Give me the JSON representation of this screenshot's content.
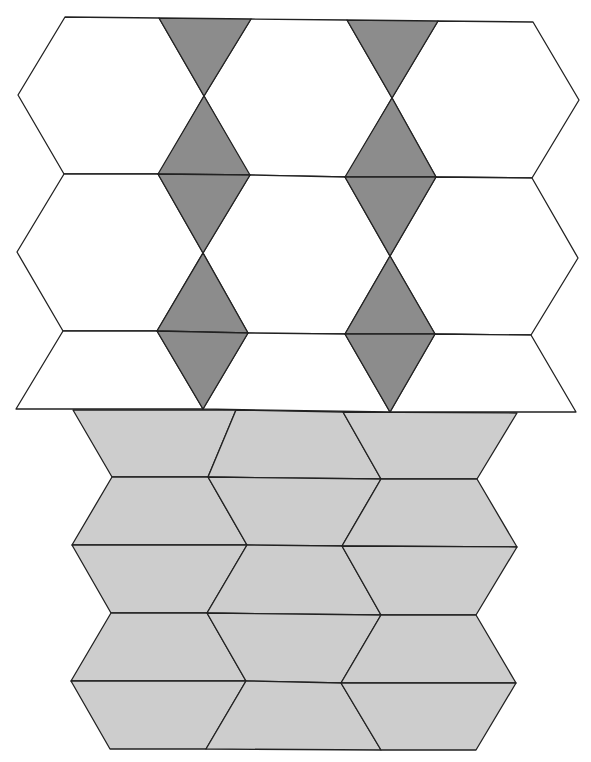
{
  "diagram": {
    "colors": {
      "hexagon_fill": "#ffffff",
      "triangle_fill": "#8c8c8c",
      "trapezoid_fill": "#cdcdcd",
      "stroke": "#222222"
    },
    "upper_section": {
      "rows": 3,
      "hexagon_columns": 3,
      "triangle_columns": 2,
      "shapes": [
        {
          "type": "hexagon",
          "fill": "white",
          "points": "65,17 159,18 204,96 159,174 64,174 18,95"
        },
        {
          "type": "hexagon",
          "fill": "white",
          "points": "251,19 347,20 392,98 346,177 249,175 204,96"
        },
        {
          "type": "hexagon",
          "fill": "white",
          "points": "438,21 533,22 579,100 532,178 436,177 392,98"
        },
        {
          "type": "hexagon",
          "fill": "white",
          "points": "64,174 158,174 203,253 157,331 63,331 17,252"
        },
        {
          "type": "hexagon",
          "fill": "white",
          "points": "250,175 345,177 390,256 345,334 248,333 203,253"
        },
        {
          "type": "hexagon",
          "fill": "white",
          "points": "436,177 532,178 578,258 531,335 435,334 390,256"
        },
        {
          "type": "trapezoid",
          "fill": "white",
          "points": "63,331 157,331 203,409 16,409"
        },
        {
          "type": "trapezoid",
          "fill": "white",
          "points": "248,333 345,334 390,412 203,409"
        },
        {
          "type": "trapezoid",
          "fill": "white",
          "points": "435,334 531,335 576,412 390,412"
        },
        {
          "type": "triangle",
          "fill": "dark",
          "points": "159,18 251,19 204,96"
        },
        {
          "type": "triangle",
          "fill": "dark",
          "points": "347,20 438,21 392,98"
        },
        {
          "type": "triangle",
          "fill": "dark",
          "points": "204,96 250,175 158,174"
        },
        {
          "type": "triangle",
          "fill": "dark",
          "points": "392,98 436,177 345,177"
        },
        {
          "type": "triangle",
          "fill": "dark",
          "points": "158,174 250,175 203,253"
        },
        {
          "type": "triangle",
          "fill": "dark",
          "points": "345,177 436,177 390,256"
        },
        {
          "type": "triangle",
          "fill": "dark",
          "points": "203,253 248,333 157,331"
        },
        {
          "type": "triangle",
          "fill": "dark",
          "points": "390,256 435,334 345,334"
        },
        {
          "type": "triangle",
          "fill": "dark",
          "points": "157,331 248,333 203,409"
        },
        {
          "type": "triangle",
          "fill": "dark",
          "points": "345,334 435,334 390,412"
        }
      ]
    },
    "lower_section": {
      "rows": 5,
      "trapezoids_per_row": 3,
      "shapes": [
        {
          "type": "trapezoid",
          "fill": "light",
          "points": "73,410 236,410 208,477 112,477"
        },
        {
          "type": "trapezoid",
          "fill": "light",
          "points": "236,410 343,412 381,479 208,477"
        },
        {
          "type": "trapezoid",
          "fill": "light",
          "points": "343,412 517,413 477,479 381,479"
        },
        {
          "type": "trapezoid",
          "fill": "light",
          "points": "112,477 208,477 247,545 72,545"
        },
        {
          "type": "trapezoid",
          "fill": "light",
          "points": "208,477 381,479 342,546 247,545"
        },
        {
          "type": "trapezoid",
          "fill": "light",
          "points": "381,479 477,479 517,547 342,546"
        },
        {
          "type": "trapezoid",
          "fill": "light",
          "points": "72,545 247,545 207,613 111,613"
        },
        {
          "type": "trapezoid",
          "fill": "light",
          "points": "247,545 342,546 381,615 207,613"
        },
        {
          "type": "trapezoid",
          "fill": "light",
          "points": "342,546 517,547 476,615 381,615"
        },
        {
          "type": "trapezoid",
          "fill": "light",
          "points": "111,613 207,613 246,681 71,681"
        },
        {
          "type": "trapezoid",
          "fill": "light",
          "points": "207,613 381,615 341,683 246,681"
        },
        {
          "type": "trapezoid",
          "fill": "light",
          "points": "381,615 476,615 516,683 341,683"
        },
        {
          "type": "trapezoid",
          "fill": "light",
          "points": "71,681 246,681 206,749 110,749"
        },
        {
          "type": "trapezoid",
          "fill": "light",
          "points": "246,681 341,683 381,750 206,749"
        },
        {
          "type": "trapezoid",
          "fill": "light",
          "points": "341,683 516,683 476,750 381,750"
        }
      ]
    }
  }
}
